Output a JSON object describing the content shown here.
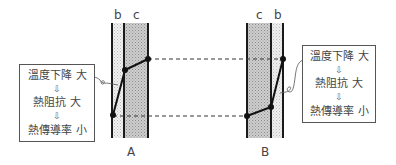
{
  "diagram": {
    "walls": [
      {
        "id": "A",
        "label": "A",
        "layers": [
          {
            "label": "b",
            "shading": "light"
          },
          {
            "label": "c",
            "shading": "dark"
          }
        ],
        "temperature_profile": [
          {
            "x": 113,
            "y": 115
          },
          {
            "x": 125,
            "y": 70
          },
          {
            "x": 148,
            "y": 59
          }
        ]
      },
      {
        "id": "B",
        "label": "B",
        "layers": [
          {
            "label": "c",
            "shading": "dark"
          },
          {
            "label": "b",
            "shading": "light"
          }
        ],
        "temperature_profile": [
          {
            "x": 247,
            "y": 116
          },
          {
            "x": 271,
            "y": 107
          },
          {
            "x": 283,
            "y": 59
          }
        ]
      }
    ],
    "annotations": [
      {
        "id": "left",
        "points_to": "layer b of wall A",
        "lines": [
          {
            "text": "溫度下降",
            "qualifier": "大"
          },
          {
            "text": "熱阻抗",
            "qualifier": "大"
          },
          {
            "text": "熱傳導率",
            "qualifier": "小"
          }
        ],
        "arrow_glyph": "⇩"
      },
      {
        "id": "right",
        "points_to": "layer b of wall B",
        "lines": [
          {
            "text": "溫度下降",
            "qualifier": "大"
          },
          {
            "text": "熱阻抗",
            "qualifier": "大"
          },
          {
            "text": "熱傳導率",
            "qualifier": "小"
          }
        ],
        "arrow_glyph": "⇩"
      }
    ],
    "colors": {
      "wall_line": "#1a1a1a",
      "dark_fill": "#bdbdbd",
      "light_fill": "#e6e6e6",
      "dashed": "#333333"
    }
  }
}
